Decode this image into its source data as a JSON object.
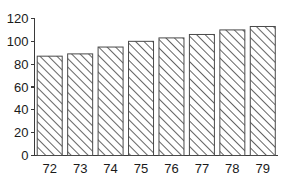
{
  "chart_data": {
    "type": "bar",
    "title": "",
    "subtitle": "",
    "xlabel": "",
    "ylabel": "",
    "categories": [
      "72",
      "73",
      "74",
      "75",
      "76",
      "77",
      "78",
      "79"
    ],
    "values": [
      87,
      89,
      95,
      100,
      103,
      106,
      110,
      113
    ],
    "series": [
      {
        "name": "",
        "values": [
          87,
          89,
          95,
          100,
          103,
          106,
          110,
          113
        ]
      }
    ],
    "ylim": [
      0,
      120
    ],
    "yticks": [
      0,
      20,
      40,
      60,
      80,
      100,
      120
    ],
    "ytick_labels": [
      "0",
      "20",
      "40",
      "60",
      "80",
      "100",
      "120"
    ],
    "xtick_labels": [
      "72",
      "73",
      "74",
      "75",
      "76",
      "77",
      "78",
      "79"
    ],
    "grid": false,
    "legend": null,
    "legend_position": "none",
    "annotations": [],
    "bar_fill": "hatch-diagonal-forward",
    "bar_fill_color": "#ffffff",
    "bar_edge_color": "#4a4a4a",
    "axis_color": "#3a3a3a",
    "text_color": "#1a1a1a",
    "background_color": "#ffffff"
  }
}
